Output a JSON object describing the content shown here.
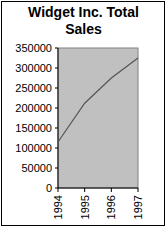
{
  "chart_data": {
    "type": "line",
    "title": "Widget Inc. Total Sales",
    "title_lines": [
      "Widget Inc. Total",
      "Sales"
    ],
    "xlabel": "",
    "ylabel": "",
    "categories": [
      "1994",
      "1995",
      "1996",
      "1997"
    ],
    "series": [
      {
        "name": "Total Sales",
        "values": [
          115000,
          212000,
          275000,
          325000
        ]
      }
    ],
    "ylim": [
      0,
      350000
    ],
    "yticks": [
      0,
      50000,
      100000,
      150000,
      200000,
      250000,
      300000,
      350000
    ],
    "ytick_labels": [
      "0",
      "50000",
      "100000",
      "150000",
      "200000",
      "250000",
      "300000",
      "350000"
    ],
    "grid": false,
    "legend": "none",
    "colors": {
      "plot_bg": "#c0c0c0",
      "line": "#555555",
      "axis": "#000000"
    }
  }
}
